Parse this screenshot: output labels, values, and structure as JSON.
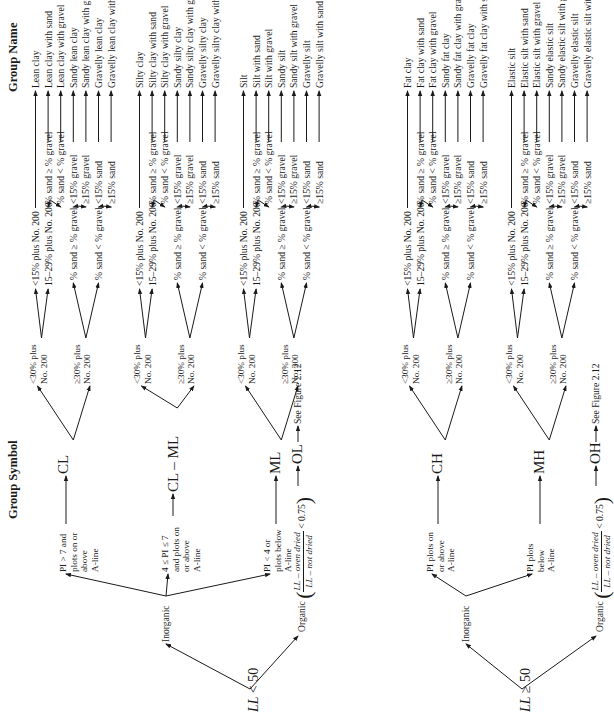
{
  "headers": {
    "group_symbol": "Group Symbol",
    "group_name": "Group Name"
  },
  "roots": [
    {
      "label_var": "LL",
      "label_op": "< 50"
    },
    {
      "label_var": "LL",
      "label_op": "≥ 50"
    }
  ],
  "branches": {
    "inorganic": "Inorganic",
    "organic": "Organic",
    "organic_ratio_num": "LL – oven dried",
    "organic_ratio_den": "LL – not dried",
    "organic_ratio_cmp": "< 0.75",
    "see_figure": "See Figure 2.12"
  },
  "pi_conditions": {
    "cl": [
      "PI > 7 and",
      "plots on or",
      "above",
      "A-line"
    ],
    "clml": [
      "4 ≤ PI ≤ 7",
      "and plots on",
      "or above",
      "A-line"
    ],
    "ml": [
      "PI < 4 or",
      "plots below",
      "A-line"
    ],
    "ch": [
      "PI plots on",
      "or above",
      "A-line"
    ],
    "mh": [
      "PI plots",
      "below",
      "A-line"
    ]
  },
  "symbols": {
    "cl": "CL",
    "clml": "CL – ML",
    "ml": "ML",
    "ol": "OL",
    "ch": "CH",
    "mh": "MH",
    "oh": "OH"
  },
  "level1": {
    "lt30": [
      "<30% plus",
      "No. 200"
    ],
    "ge30": [
      "≥30% plus",
      "No. 200"
    ]
  },
  "level2": {
    "lt15": "<15% plus No. 200",
    "r15_29": "15–29% plus No. 200",
    "sand_ge_gravel": "% sand ≥ % gravel",
    "sand_lt_gravel": "% sand < % gravel"
  },
  "level3": [
    "% sand ≥ % gravel",
    "% sand < % gravel",
    "<15% gravel",
    "≥15% gravel",
    "<15% sand",
    "≥15% sand"
  ],
  "groups": [
    {
      "symbol": "CL",
      "names": [
        "Lean clay",
        "Lean clay with sand",
        "Lean clay with gravel",
        "Sandy lean clay",
        "Sandy lean clay with gravel",
        "Gravelly lean clay",
        "Gravelly lean clay with sand"
      ]
    },
    {
      "symbol": "CL – ML",
      "names": [
        "Silty clay",
        "Silty clay with sand",
        "Silty clay with gravel",
        "Sandy silty clay",
        "Sandy silty clay with gravel",
        "Gravelly silty clay",
        "Gravelly silty clay with sand"
      ]
    },
    {
      "symbol": "ML",
      "names": [
        "Silt",
        "Silt with sand",
        "Silt with gravel",
        "Sandy silt",
        "Sandy silt with gravel",
        "Gravelly silt",
        "Gravelly silt with sand"
      ]
    },
    {
      "symbol": "CH",
      "names": [
        "Fat clay",
        "Fat clay with sand",
        "Fat clay with gravel",
        "Sandy fat clay",
        "Sandy fat clay with gravel",
        "Gravelly fat clay",
        "Gravelly fat clay with sand"
      ]
    },
    {
      "symbol": "MH",
      "names": [
        "Elastic silt",
        "Elastic silt with sand",
        "Elastic silt with gravel",
        "Sandy elastic silt",
        "Sandy elastic silt with gravel",
        "Gravelly elastic silt",
        "Gravelly elastic silt with sand"
      ]
    }
  ]
}
